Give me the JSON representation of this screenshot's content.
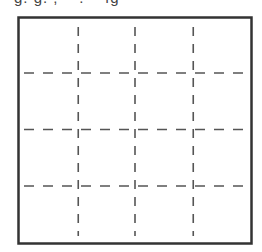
{
  "caption": {
    "text": "g. g. ;    .    ıg",
    "note": "partially cropped text fragment at top edge"
  },
  "figure": {
    "type": "grid",
    "rows": 4,
    "columns": 4,
    "outer_border": "solid",
    "inner_lines": "dashed",
    "colors": {
      "border": "#333333",
      "dash": "#555555",
      "background": "#ffffff"
    }
  }
}
